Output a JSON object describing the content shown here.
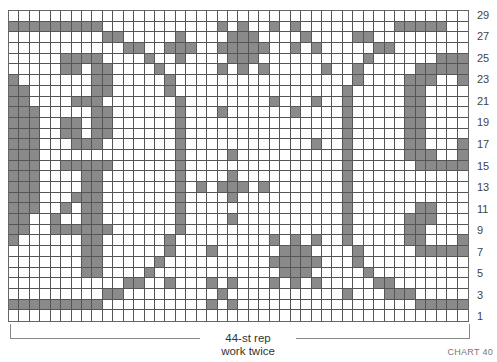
{
  "chart": {
    "columns": 44,
    "rows": 29,
    "colors": {
      "filled": "#8a8a8a",
      "empty": "#ffffff",
      "gridline": "#555555"
    },
    "grid_top_to_bottom": [
      "............................................",
      "#########...........#.#..#.#.........#####",
      ".........##.....#....###....#....##.......",
      "...........##..###..#####..#.#.....##.......",
      ".....####....#..#....###..........#......###",
      ".....##.##....#.....#.#.#.....#..#.....#####",
      "#.......##.....#.................#....###..#",
      "##......##.....#................#.....##....",
      "##....###.......#........#...#..#.....##....",
      "###.....##......#...#......#....#.....##....",
      "###..##.##......#...............#.....##....",
      "###..##.##......#...............#.....##....",
      "###...###.......#............#..#.....##...#",
      "###.............#....#..........#.....###..#",
      "###..#####......#...............#......#####",
      "###....##.......#....#..........#...........",
      "###....##.......#.#.###.#.......#...........",
      "###...###.......#....#..........#...........",
      "###..#.##.......#...............#......##...",
      "##..#..##.......#....#..........#.....###...",
      "##..######......#...............#.....##....",
      "#......##......#.........#.#.#..#.....##...#",
      ".......##......#...#......###....#.....#####",
      ".......##.....#..........#####...#..........",
      ".......##....#............###.....#.........",
      "...........##..#...#.#...#.#.#.....##.......",
      ".........##.........#...........#...###.....",
      "#########..........#.#.................#####",
      "............................................"
    ],
    "row_numbers": [
      "29",
      "27",
      "25",
      "23",
      "21",
      "19",
      "17",
      "15",
      "13",
      "11",
      "9",
      "7",
      "5",
      "3",
      "1"
    ]
  },
  "footer": {
    "repeat_label": "44-st rep",
    "repeat_note": "work twice",
    "chart_id": "CHART 40"
  }
}
